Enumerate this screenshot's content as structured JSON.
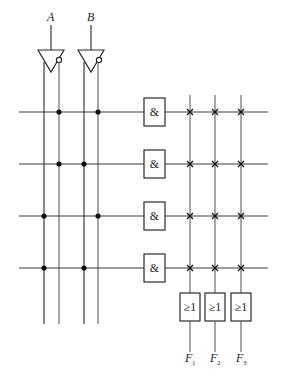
{
  "diagram": {
    "type": "PLA",
    "inputs": [
      {
        "name": "A"
      },
      {
        "name": "B"
      }
    ],
    "input_lines": [
      "A",
      "A'",
      "B",
      "B'"
    ],
    "and_gate_symbol": "&",
    "or_gate_symbol": "≥1",
    "product_terms": [
      {
        "id": "P1",
        "connections": [
          "A'",
          "B'"
        ]
      },
      {
        "id": "P2",
        "connections": [
          "A'",
          "B"
        ]
      },
      {
        "id": "P3",
        "connections": [
          "A",
          "B'"
        ]
      },
      {
        "id": "P4",
        "connections": [
          "A",
          "B"
        ]
      }
    ],
    "outputs": [
      {
        "name": "F",
        "sub": "1",
        "terms": [
          "P1",
          "P2",
          "P3",
          "P4"
        ]
      },
      {
        "name": "F",
        "sub": "2",
        "terms": [
          "P1",
          "P2",
          "P3",
          "P4"
        ]
      },
      {
        "name": "F",
        "sub": "3",
        "terms": [
          "P1",
          "P2",
          "P3",
          "P4"
        ]
      }
    ],
    "fixed_connection_marker": "dot",
    "programmable_connection_marker": "cross"
  }
}
